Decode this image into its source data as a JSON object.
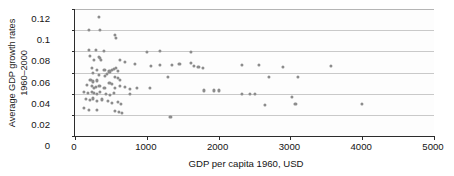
{
  "chart_data": {
    "type": "scatter",
    "title": "",
    "xlabel": "GDP per capita 1960, USD",
    "ylabel_line1": "Average GDP growth rates",
    "ylabel_line2": "1960–2000",
    "xlim": [
      0,
      5000
    ],
    "ylim": [
      0,
      0.12
    ],
    "xticks": [
      0,
      1000,
      2000,
      3000,
      4000,
      5000
    ],
    "xtick_labels": [
      "0",
      "1000",
      "2000",
      "3000",
      "4000",
      "5000"
    ],
    "yticks": [
      0,
      0.02,
      0.04,
      0.06,
      0.08,
      0.1,
      0.12
    ],
    "ytick_labels": [
      "0",
      "0.02",
      "0.04",
      "0.06",
      "0.08",
      "0.1",
      "0.12"
    ],
    "grid": "horizontal",
    "legend": "none",
    "marker_color": "#8c8c8c",
    "axis_color": "#2c2c2c",
    "grid_color": "#c9c9c9",
    "points": [
      [
        330,
        0.1125
      ],
      [
        190,
        0.1005
      ],
      [
        350,
        0.1005
      ],
      [
        560,
        0.0955
      ],
      [
        575,
        0.093
      ],
      [
        200,
        0.0815
      ],
      [
        290,
        0.081
      ],
      [
        400,
        0.08
      ],
      [
        1000,
        0.0795
      ],
      [
        1180,
        0.08
      ],
      [
        1620,
        0.0795
      ],
      [
        205,
        0.076
      ],
      [
        330,
        0.0745
      ],
      [
        350,
        0.0735
      ],
      [
        365,
        0.072
      ],
      [
        260,
        0.0715
      ],
      [
        620,
        0.072
      ],
      [
        700,
        0.07
      ],
      [
        830,
        0.0685
      ],
      [
        1060,
        0.0665
      ],
      [
        1180,
        0.067
      ],
      [
        1345,
        0.067
      ],
      [
        1455,
        0.068
      ],
      [
        1610,
        0.069
      ],
      [
        1660,
        0.0665
      ],
      [
        1720,
        0.065
      ],
      [
        1780,
        0.064
      ],
      [
        2320,
        0.0675
      ],
      [
        2560,
        0.067
      ],
      [
        2900,
        0.065
      ],
      [
        3560,
        0.066
      ],
      [
        235,
        0.064
      ],
      [
        300,
        0.062
      ],
      [
        410,
        0.062
      ],
      [
        480,
        0.061
      ],
      [
        520,
        0.0625
      ],
      [
        545,
        0.0635
      ],
      [
        575,
        0.0645
      ],
      [
        600,
        0.0615
      ],
      [
        250,
        0.0595
      ],
      [
        330,
        0.058
      ],
      [
        420,
        0.057
      ],
      [
        440,
        0.059
      ],
      [
        560,
        0.0555
      ],
      [
        600,
        0.0545
      ],
      [
        630,
        0.053
      ],
      [
        1290,
        0.056
      ],
      [
        2700,
        0.0555
      ],
      [
        3100,
        0.056
      ],
      [
        215,
        0.053
      ],
      [
        250,
        0.0515
      ],
      [
        300,
        0.0525
      ],
      [
        480,
        0.0505
      ],
      [
        520,
        0.049
      ],
      [
        170,
        0.048
      ],
      [
        230,
        0.047
      ],
      [
        260,
        0.0455
      ],
      [
        290,
        0.0465
      ],
      [
        340,
        0.047
      ],
      [
        410,
        0.0455
      ],
      [
        560,
        0.045
      ],
      [
        620,
        0.047
      ],
      [
        700,
        0.0465
      ],
      [
        760,
        0.0445
      ],
      [
        860,
        0.0455
      ],
      [
        1050,
        0.045
      ],
      [
        1800,
        0.043
      ],
      [
        1930,
        0.043
      ],
      [
        2010,
        0.043
      ],
      [
        130,
        0.0415
      ],
      [
        180,
        0.0405
      ],
      [
        230,
        0.042
      ],
      [
        270,
        0.041
      ],
      [
        300,
        0.04
      ],
      [
        350,
        0.0415
      ],
      [
        430,
        0.04
      ],
      [
        490,
        0.039
      ],
      [
        540,
        0.0405
      ],
      [
        770,
        0.0395
      ],
      [
        2320,
        0.04
      ],
      [
        2440,
        0.0395
      ],
      [
        2500,
        0.0395
      ],
      [
        3020,
        0.037
      ],
      [
        150,
        0.035
      ],
      [
        210,
        0.034
      ],
      [
        250,
        0.0355
      ],
      [
        310,
        0.033
      ],
      [
        380,
        0.0345
      ],
      [
        460,
        0.033
      ],
      [
        520,
        0.031
      ],
      [
        600,
        0.032
      ],
      [
        640,
        0.03
      ],
      [
        2640,
        0.0295
      ],
      [
        3070,
        0.03
      ],
      [
        4000,
        0.03
      ],
      [
        130,
        0.0265
      ],
      [
        190,
        0.025
      ],
      [
        300,
        0.0245
      ],
      [
        560,
        0.024
      ],
      [
        610,
        0.0225
      ],
      [
        660,
        0.0215
      ],
      [
        1330,
        0.018
      ]
    ]
  }
}
